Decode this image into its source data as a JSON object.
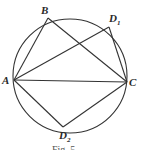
{
  "figure": {
    "circle": {
      "cx": 70,
      "cy": 76,
      "r": 57
    },
    "points": {
      "A": {
        "label": "A",
        "sub": "",
        "x": 14,
        "y": 80
      },
      "B": {
        "label": "B",
        "sub": "",
        "x": 48,
        "y": 18
      },
      "D1": {
        "label": "D",
        "sub": "1",
        "x": 109,
        "y": 27
      },
      "C": {
        "label": "C",
        "sub": "",
        "x": 127,
        "y": 82
      },
      "D2": {
        "label": "D",
        "sub": "2",
        "x": 63,
        "y": 127
      }
    },
    "segments": [
      [
        "A",
        "B"
      ],
      [
        "B",
        "C"
      ],
      [
        "A",
        "D1"
      ],
      [
        "D1",
        "C"
      ],
      [
        "A",
        "C"
      ],
      [
        "A",
        "D2"
      ],
      [
        "D2",
        "C"
      ]
    ],
    "caption": "Fig. 5",
    "stroke_color": "#333333"
  }
}
